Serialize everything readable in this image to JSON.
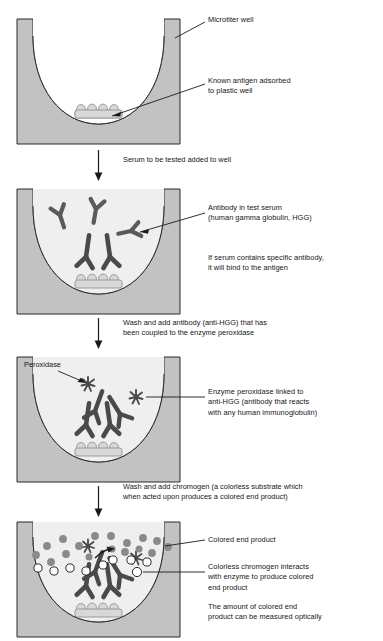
{
  "diagram": {
    "colors": {
      "well_wall": "#c2c2c2",
      "well_outline": "#2b2b2b",
      "liquid": "#efefef",
      "empty": "#ffffff",
      "antibody": "#5a5a5a",
      "antibody_dark": "#4a4a4a",
      "antigen_fill": "#d8d8d8",
      "antigen_outline": "#8a8a8a",
      "colored_product": "#8a8a8a",
      "colorless_chromogen": "#ffffff",
      "leader_line": "#1a1a1a",
      "text": "#151515"
    }
  },
  "panels": [
    {
      "id": "panel-empty-well",
      "name": "coated well",
      "labels": [
        {
          "id": "microtiter-well",
          "text": "Microtiter well"
        },
        {
          "id": "known-antigen",
          "text": "Known antigen adsorbed\nto plastic well"
        }
      ]
    },
    {
      "id": "panel-serum-added",
      "name": "test serum added",
      "labels": [
        {
          "id": "antibody-in-test-serum",
          "text": "Antibody in test serum\n(human gamma globulin, HGG)"
        },
        {
          "id": "specific-antibody-binds",
          "text": "If serum contains specific antibody,\nit will bind to the antigen"
        }
      ]
    },
    {
      "id": "panel-conjugate-added",
      "name": "enzyme conjugated anti-HGG added",
      "labels": [
        {
          "id": "peroxidase",
          "text": "Peroxidase"
        },
        {
          "id": "enzyme-peroxidase-linked",
          "text": "Enzyme peroxidase linked to\nanti-HGG (antibody that reacts\nwith any human immunoglobulin)"
        }
      ]
    },
    {
      "id": "panel-chromogen-added",
      "name": "chromogen added and color develops",
      "labels": [
        {
          "id": "colored-end-product",
          "text": "Colored end product"
        },
        {
          "id": "colorless-chromogen",
          "text": "Colorless chromogen interacts\nwith enzyme to produce colored\nend product"
        },
        {
          "id": "amount-measured",
          "text": "The amount of colored end\nproduct can be measured optically"
        }
      ]
    }
  ],
  "steps": [
    {
      "id": "step-1",
      "text": "Serum to be tested added to well"
    },
    {
      "id": "step-2",
      "text": "Wash and add antibody (anti-HGG) that has\nbeen coupled to the enzyme peroxidase"
    },
    {
      "id": "step-3",
      "text": "Wash and add chromogen (a colorless substrate which\nwhen acted upon produces a colored end product)"
    }
  ],
  "counts": {
    "antigen_bumps": 4,
    "free_antibodies_panel2": 3,
    "bound_antibodies_panel2": 2,
    "conjugate_antibodies_panel3": 2,
    "bound_antibodies_panel3": 2,
    "colored_dots_panel4": 17,
    "colorless_circles_panel4": 9
  }
}
